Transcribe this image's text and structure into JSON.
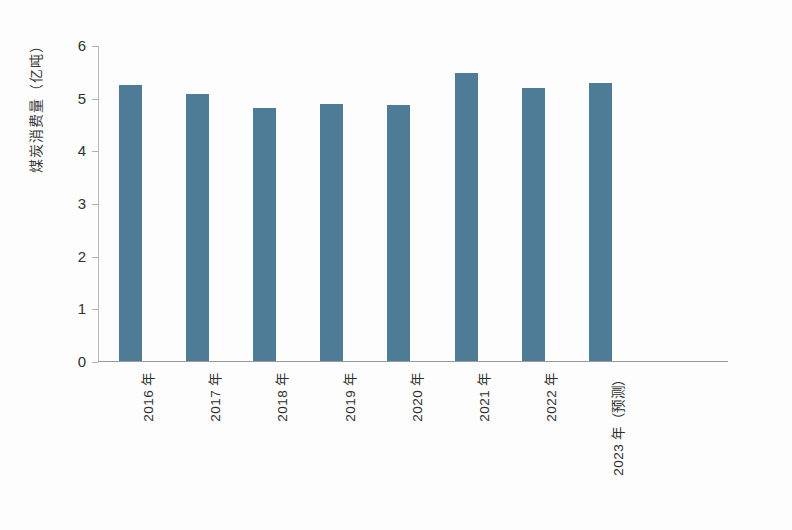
{
  "chart_data": {
    "type": "bar",
    "title": "",
    "xlabel": "",
    "ylabel": "煤炭消费量（亿吨）",
    "ylim": [
      0,
      6
    ],
    "yticks": [
      "0",
      "1",
      "2",
      "3",
      "4",
      "5",
      "6"
    ],
    "grid": false,
    "legend": "none",
    "bar_color": "#4e7b95",
    "categories": [
      "2016 年",
      "2017 年",
      "2018 年",
      "2019 年",
      "2020 年",
      "2021 年",
      "2022 年",
      "2023 年（预测）"
    ],
    "values": [
      5.25,
      5.07,
      4.8,
      4.88,
      4.87,
      5.47,
      5.19,
      5.27
    ]
  },
  "axes": {
    "y_title": "煤炭消费量（亿吨）"
  }
}
